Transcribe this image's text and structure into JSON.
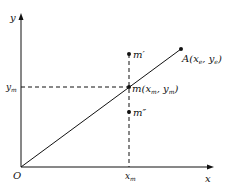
{
  "diagram": {
    "axes": {
      "x_label": "x",
      "y_label": "y",
      "origin_label": "O"
    },
    "points": {
      "A": {
        "label": "A",
        "coord": "(x",
        "sub1": "e",
        "sep": ",  y",
        "sub2": "e",
        "close": ")"
      },
      "m": {
        "label": "m",
        "coord": "(x",
        "sub1": "m",
        "sep": ",  y",
        "sub2": "m",
        "close": ")"
      },
      "m_prime": {
        "label": "m′"
      },
      "m_double_prime": {
        "label": "m″"
      }
    },
    "ticks": {
      "x_m": "x",
      "x_m_sub": "m",
      "y_m": "y",
      "y_m_sub": "m"
    },
    "colors": {
      "line": "#111111"
    }
  }
}
